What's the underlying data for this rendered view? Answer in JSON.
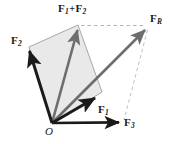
{
  "figure": {
    "type": "vector-diagram",
    "width": 174,
    "height": 144,
    "background": "#ffffff",
    "colors": {
      "vector_dark": "#1a1a1a",
      "vector_gray": "#6e6e6e",
      "parallelogram_fill": "#e9e9e9",
      "parallelogram_edge": "#9a9a9a",
      "dashed_line": "#b4b4b4",
      "label_text": "#1a1a1a"
    },
    "origin": {
      "label": "O",
      "x": 52,
      "y": 123
    },
    "vectors": [
      {
        "name": "F1",
        "label_main": "F",
        "label_sub": "1",
        "style": "solid-dark",
        "from": [
          52,
          123
        ],
        "to": [
          97,
          96
        ],
        "label_x": 98,
        "label_y": 104
      },
      {
        "name": "F2",
        "label_main": "F",
        "label_sub": "2",
        "style": "solid-dark",
        "from": [
          52,
          123
        ],
        "to": [
          29,
          47
        ],
        "label_x": 12,
        "label_y": 35
      },
      {
        "name": "F3",
        "label_main": "F",
        "label_sub": "3",
        "style": "solid-dark",
        "from": [
          52,
          123
        ],
        "to": [
          122,
          122
        ],
        "label_x": 125,
        "label_y": 117
      },
      {
        "name": "F1plusF2",
        "label_main": "F",
        "label_sub": "1",
        "label_main2": "F",
        "label_sub2": "2",
        "label_operator": "+",
        "style": "solid-gray",
        "from": [
          52,
          123
        ],
        "to": [
          77,
          26
        ],
        "label_x": 58,
        "label_y": 3
      },
      {
        "name": "FR",
        "label_main": "F",
        "label_sub": "R",
        "style": "solid-gray",
        "from": [
          52,
          123
        ],
        "to": [
          148,
          27
        ],
        "label_x": 150,
        "label_y": 13
      }
    ],
    "parallelogram": {
      "vertices": [
        [
          52,
          123
        ],
        [
          29,
          47
        ],
        [
          78,
          25
        ],
        [
          102,
          92
        ]
      ],
      "fill": "#e9e9e9"
    },
    "dashed_lines": [
      {
        "name": "apex-to-resultant",
        "from": [
          80,
          25
        ],
        "to": [
          146,
          25
        ]
      },
      {
        "name": "resultant-to-f3-tip",
        "from": [
          148,
          29
        ],
        "to": [
          124,
          121
        ]
      }
    ]
  }
}
